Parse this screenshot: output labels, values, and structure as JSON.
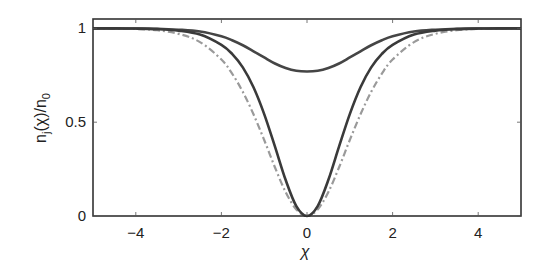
{
  "chart_data": {
    "type": "line",
    "title": "",
    "xlabel": "χ",
    "ylabel": "n_j(χ)/n_0",
    "ylabel_parts": {
      "base": "n",
      "sub1": "j",
      "mid": "(χ)/n",
      "sub2": "0"
    },
    "xlim": [
      -5,
      5
    ],
    "ylim": [
      0,
      1.05
    ],
    "xticks": [
      -4,
      -2,
      0,
      2,
      4
    ],
    "xtick_labels": [
      "−4",
      "−2",
      "0",
      "2",
      "4"
    ],
    "yticks": [
      0,
      0.5,
      1
    ],
    "ytick_labels": [
      "0",
      "0.5",
      "1"
    ],
    "grid": false,
    "legend": null,
    "x": [
      -5,
      -4.5,
      -4,
      -3.5,
      -3,
      -2.5,
      -2,
      -1.75,
      -1.5,
      -1.25,
      -1,
      -0.75,
      -0.5,
      -0.25,
      0,
      0.25,
      0.5,
      0.75,
      1,
      1.25,
      1.5,
      1.75,
      2,
      2.5,
      3,
      3.5,
      4,
      4.5,
      5
    ],
    "series": [
      {
        "name": "shallow-dip (solid)",
        "style": "solid",
        "color": "#454545",
        "values": [
          1.0,
          1.0,
          0.999,
          0.998,
          0.993,
          0.983,
          0.958,
          0.937,
          0.91,
          0.878,
          0.845,
          0.813,
          0.789,
          0.774,
          0.77,
          0.774,
          0.789,
          0.813,
          0.845,
          0.878,
          0.91,
          0.937,
          0.958,
          0.983,
          0.993,
          0.998,
          0.999,
          1.0,
          1.0
        ]
      },
      {
        "name": "dark-soliton (solid)",
        "style": "solid",
        "color": "#3a3a3a",
        "values": [
          1.0,
          1.0,
          0.999,
          0.996,
          0.988,
          0.967,
          0.912,
          0.864,
          0.792,
          0.686,
          0.543,
          0.371,
          0.193,
          0.053,
          0.0,
          0.053,
          0.193,
          0.371,
          0.543,
          0.686,
          0.792,
          0.864,
          0.912,
          0.967,
          0.988,
          0.996,
          0.999,
          1.0,
          1.0
        ]
      },
      {
        "name": "dark-soliton (dash-dot)",
        "style": "dashdot",
        "color": "#9a9a9a",
        "values": [
          1.0,
          0.999,
          0.997,
          0.99,
          0.971,
          0.927,
          0.834,
          0.759,
          0.662,
          0.542,
          0.405,
          0.26,
          0.128,
          0.035,
          0.0,
          0.035,
          0.128,
          0.26,
          0.405,
          0.542,
          0.662,
          0.759,
          0.834,
          0.927,
          0.971,
          0.99,
          0.997,
          0.999,
          1.0
        ]
      }
    ]
  }
}
